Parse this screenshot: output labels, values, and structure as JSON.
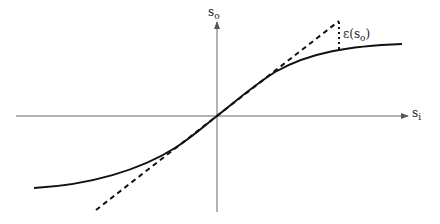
{
  "figure": {
    "type": "transfer-curve-diagram",
    "axes": {
      "x_label": "s",
      "x_label_sub": "i",
      "y_label": "s",
      "y_label_sub": "o",
      "origin": [
        217,
        116
      ],
      "color": "#555555"
    },
    "curve": {
      "name": "saturating-transfer-curve",
      "color": "#111111"
    },
    "tangent": {
      "name": "linear-approximation",
      "style": "dashed",
      "color": "#111111"
    },
    "error_marker": {
      "label_prefix": "ε(",
      "label_var": "s",
      "label_sub": "o",
      "label_suffix": ")",
      "style": "dotted"
    }
  }
}
